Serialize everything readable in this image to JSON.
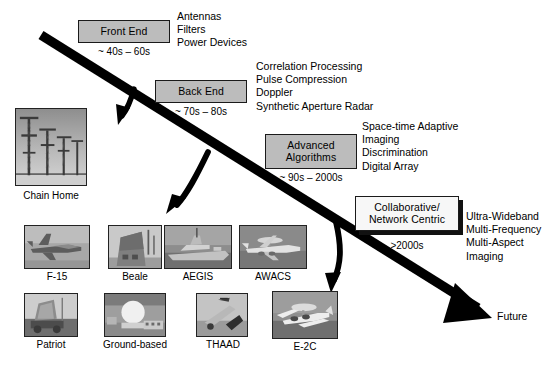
{
  "diagram": {
    "future_label": "Future",
    "colors": {
      "box_fill": "#bcbcbc",
      "box_fill_light": "#f7f7f7",
      "box_border": "#1a1a1a",
      "arrow": "#000000",
      "background": "#ffffff"
    }
  },
  "stages": [
    {
      "id": "front-end",
      "label": "Front End",
      "era": "~ 40s – 60s",
      "style": "gray",
      "technologies": [
        "Antennas",
        "Filters",
        "Power Devices"
      ]
    },
    {
      "id": "back-end",
      "label": "Back End",
      "era": "~ 70s – 80s",
      "style": "gray",
      "technologies": [
        "Correlation Processing",
        "Pulse Compression",
        "Doppler",
        "Synthetic Aperture Radar"
      ]
    },
    {
      "id": "advanced-algorithms",
      "label_line1": "Advanced",
      "label_line2": "Algorithms",
      "era": "~ 90s – 2000s",
      "style": "gray",
      "technologies": [
        "Space-time Adaptive",
        "Imaging",
        "Discrimination",
        "Digital Array"
      ]
    },
    {
      "id": "collaborative-network-centric",
      "label_line1": "Collaborative/",
      "label_line2": "Network Centric",
      "era": ">2000s",
      "style": "white",
      "technologies": [
        "Ultra-Wideband",
        "Multi-Frequency",
        "Multi-Aspect",
        "Imaging"
      ]
    }
  ],
  "systems": [
    {
      "id": "chain-home",
      "caption": "Chain Home",
      "icon": "radar-towers-photo"
    },
    {
      "id": "f-15",
      "caption": "F-15",
      "icon": "fighter-jet-photo"
    },
    {
      "id": "beale",
      "caption": "Beale",
      "icon": "phased-array-building-photo"
    },
    {
      "id": "aegis",
      "caption": "AEGIS",
      "icon": "naval-cruiser-photo"
    },
    {
      "id": "awacs",
      "caption": "AWACS",
      "icon": "awacs-aircraft-photo"
    },
    {
      "id": "patriot",
      "caption": "Patriot",
      "icon": "patriot-launcher-photo"
    },
    {
      "id": "ground-based",
      "caption": "Ground-based",
      "icon": "radome-site-photo"
    },
    {
      "id": "thaad",
      "caption": "THAAD",
      "icon": "thaad-launcher-photo"
    },
    {
      "id": "e-2c",
      "caption": "E-2C",
      "icon": "e2c-hawkeye-photo"
    }
  ]
}
